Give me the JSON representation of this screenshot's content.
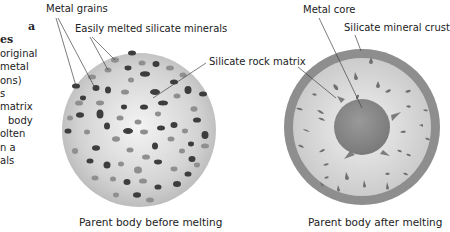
{
  "sidebar": {
    "lines": [
      "a",
      "es",
      "original",
      "metal",
      "ons)",
      "s",
      "matrix",
      "body",
      "olten",
      "n a",
      "als"
    ]
  },
  "labels": {
    "metal_grains": "Metal grains",
    "easily_melted": "Easily melted silicate minerals",
    "silicate_rock_matrix": "Silicate rock matrix",
    "metal_core": "Metal core",
    "silicate_crust": "Silicate mineral crust"
  },
  "captions": {
    "before": "Parent body before melting",
    "after": "Parent body after melting"
  },
  "colors": {
    "background": "#ffffff",
    "sphere_light": "#f2f2f2",
    "sphere_dark": "#b9b9b9",
    "metal_grain": "#3d3d3d",
    "silicate_grain": "#8f8f8f",
    "crust": "#8e8e8e",
    "core": "#8a8a8a",
    "leader_line": "#444444"
  }
}
